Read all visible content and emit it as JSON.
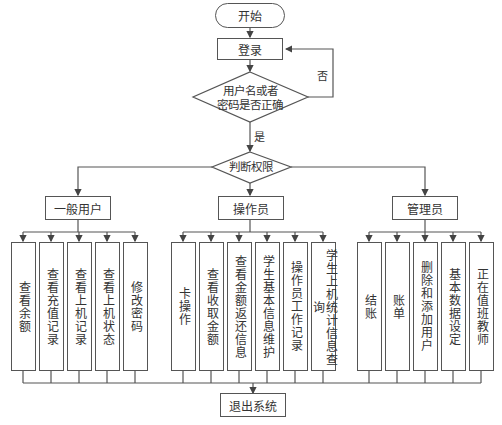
{
  "flowchart": {
    "start": "开始",
    "login": "登录",
    "check_decision": [
      "用户名或者",
      "密码是否正确"
    ],
    "no_label": "否",
    "yes_label": "是",
    "role_decision": "判断权限",
    "roles": [
      {
        "name": "一般用户",
        "functions": [
          "查看余额",
          "查看充值记录",
          "查看上机记录",
          "查看上机状态",
          "修改密码"
        ]
      },
      {
        "name": "操作员",
        "functions": [
          "卡操作",
          "查看收取金额",
          "查看金额返还信息",
          "学生基本信息维护",
          "操作员工作记录",
          "学生上机统计信息查询"
        ]
      },
      {
        "name": "管理员",
        "functions": [
          "结账",
          "账单",
          "删除和添加用户",
          "基本数据设定",
          "正在值班教师"
        ]
      }
    ],
    "end": "退出系统"
  }
}
